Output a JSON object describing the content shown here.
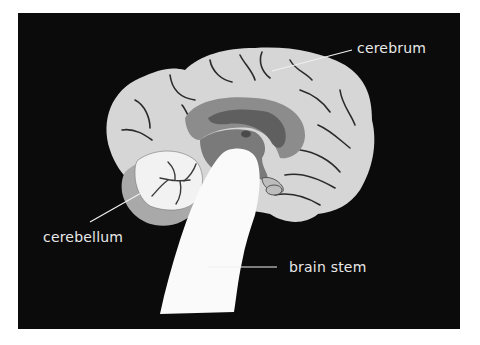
{
  "diagram": {
    "background": "#0b0b0b",
    "colors": {
      "cerebrum": "#d6d6d6",
      "sulci": "#2a2a2a",
      "corpus_callosum_ring": "#8c8c8c",
      "ventricle": "#5f5f5f",
      "thalamus": "#7a7a7a",
      "cerebellum": "#f2f2f2",
      "cerebellum_outer": "#a9a9a9",
      "brain_stem": "#fafafa"
    },
    "labels": [
      {
        "id": "cerebrum",
        "text": "cerebrum"
      },
      {
        "id": "cerebellum",
        "text": "cerebellum"
      },
      {
        "id": "brain_stem",
        "text": "brain stem"
      }
    ]
  }
}
